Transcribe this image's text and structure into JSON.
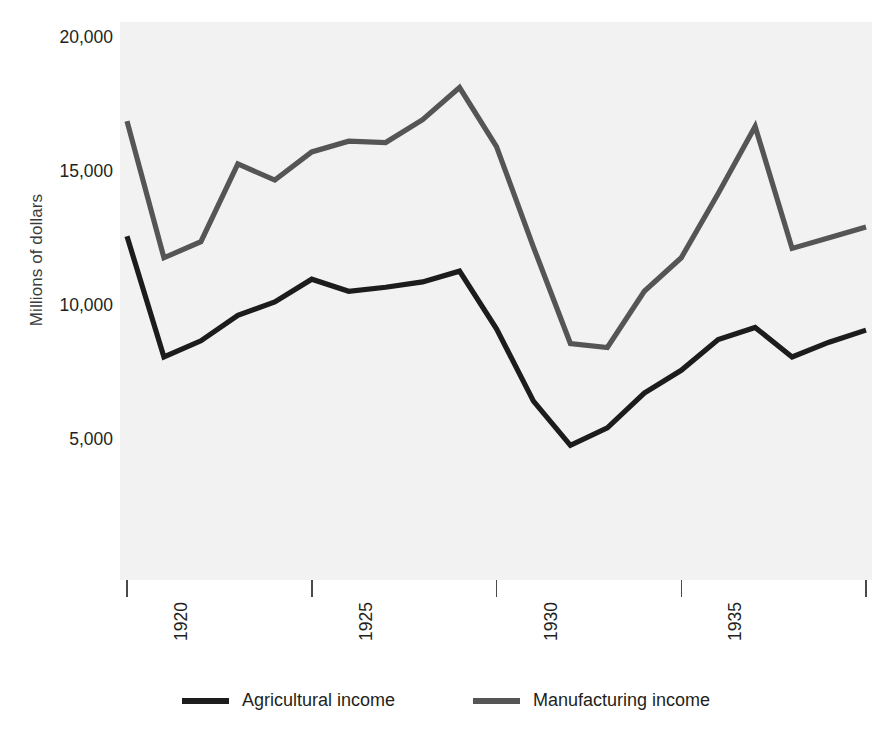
{
  "chart_data": {
    "type": "line",
    "title": "",
    "xlabel": "",
    "ylabel": "Millions of dollars",
    "xlim": [
      1920,
      1940
    ],
    "ylim": [
      0,
      20000
    ],
    "grid": false,
    "legend_position": "bottom",
    "x": [
      1920,
      1921,
      1922,
      1923,
      1924,
      1925,
      1926,
      1927,
      1928,
      1929,
      1930,
      1931,
      1932,
      1933,
      1934,
      1935,
      1936,
      1937,
      1938,
      1939,
      1940
    ],
    "x_tick_labels": [
      "1920",
      "1925",
      "1930",
      "1935",
      "1940"
    ],
    "x_tick_values": [
      1920,
      1925,
      1930,
      1935,
      1940
    ],
    "y_tick_labels": [
      "20,000",
      "15,000",
      "10,000",
      "5,000"
    ],
    "y_tick_values": [
      20000,
      15000,
      10000,
      5000
    ],
    "series": [
      {
        "name": "Agricultural income",
        "color": "#1c1c1c",
        "values": [
          12600,
          8100,
          8700,
          9650,
          10150,
          11000,
          10550,
          10700,
          10900,
          11300,
          9150,
          6450,
          4800,
          5450,
          6750,
          7600,
          8750,
          9200,
          8100,
          8650,
          9100
        ]
      },
      {
        "name": "Manufacturing income",
        "color": "#555555",
        "values": [
          16900,
          11800,
          12400,
          15300,
          14700,
          15750,
          16150,
          16100,
          16950,
          18150,
          15950,
          12200,
          8600,
          8450,
          10550,
          11800,
          14200,
          16700,
          12150,
          12550,
          12950
        ]
      }
    ]
  },
  "legend": {
    "items": [
      {
        "label": "Agricultural income",
        "color": "#1c1c1c"
      },
      {
        "label": "Manufacturing income",
        "color": "#555555"
      }
    ]
  },
  "axes": {
    "y_title": "Millions of dollars"
  },
  "colors": {
    "plot_background": "#f2f2f2",
    "page_background": "#ffffff",
    "text": "#231f20",
    "tick": "#4a4a4a"
  }
}
